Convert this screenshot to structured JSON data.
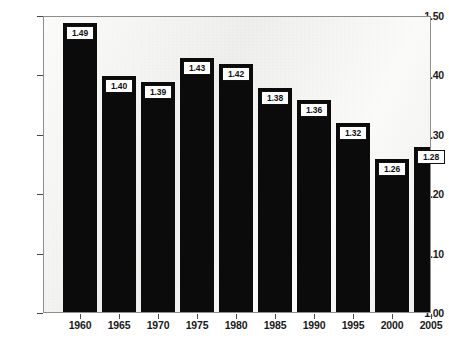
{
  "chart_data": {
    "type": "bar",
    "title": "",
    "subtitle": "",
    "xlabel": "",
    "ylabel": "",
    "categories": [
      "1960",
      "1965",
      "1970",
      "1975",
      "1980",
      "1985",
      "1990",
      "1995",
      "2000",
      "2005"
    ],
    "values": [
      1.49,
      1.4,
      1.39,
      1.43,
      1.42,
      1.38,
      1.36,
      1.32,
      1.26,
      1.28
    ],
    "data_labels": [
      "1.49",
      "1.40",
      "1.39",
      "1.43",
      "1.42",
      "1.38",
      "1.36",
      "1.32",
      "1.26",
      "1.28"
    ],
    "ylim": [
      1.0,
      1.5
    ],
    "ytick_values": [
      1.0,
      1.1,
      1.2,
      1.3,
      1.4,
      1.5
    ],
    "ytick_labels": [
      "1.00",
      "1.10",
      "1.20",
      "1.30",
      "1.40",
      "1.50"
    ],
    "grid": false,
    "legend": null,
    "legend_position": "none",
    "bar_color": "#0b0b0b",
    "plot_background": "#f0f0ee",
    "frame_color": "#8e8e8e",
    "label_box_background": "#ffffff",
    "label_box_border": "#111111",
    "axis_text_color": "#1a1a1a"
  }
}
